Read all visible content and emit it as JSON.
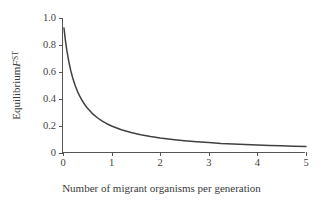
{
  "chart_data": {
    "type": "line",
    "title": "",
    "xlabel": "Number of migrant organisms per generation",
    "ylabel_plain": "Equilibrium FST",
    "ylabel_parts": {
      "prefix": "Equilibrium ",
      "variable": "F",
      "subscript": "ST"
    },
    "xlim": [
      0,
      5
    ],
    "ylim": [
      0,
      1.0
    ],
    "xticks": [
      0,
      1,
      2,
      3,
      4,
      5
    ],
    "xtick_labels": [
      "0",
      "1",
      "2",
      "3",
      "4",
      "5"
    ],
    "yticks": [
      0,
      0.2,
      0.4,
      0.6,
      0.8,
      1.0
    ],
    "ytick_labels": [
      "0",
      "0.2",
      "0.4",
      "0.6",
      "0.8",
      "1.0"
    ],
    "grid": false,
    "legend": null,
    "series": [
      {
        "name": "Equilibrium FST = 1/(4Nm + 1)",
        "color": "#404040",
        "x": [
          0.02,
          0.05,
          0.08,
          0.12,
          0.16,
          0.2,
          0.25,
          0.3,
          0.35,
          0.4,
          0.45,
          0.5,
          0.6,
          0.7,
          0.8,
          0.9,
          1.0,
          1.2,
          1.4,
          1.6,
          1.8,
          2.0,
          2.25,
          2.5,
          2.75,
          3.0,
          3.25,
          3.5,
          3.75,
          4.0,
          4.25,
          4.5,
          4.75,
          5.0
        ],
        "y": [
          0.926,
          0.833,
          0.758,
          0.676,
          0.61,
          0.556,
          0.5,
          0.455,
          0.417,
          0.385,
          0.357,
          0.333,
          0.294,
          0.263,
          0.238,
          0.217,
          0.2,
          0.172,
          0.152,
          0.135,
          0.122,
          0.111,
          0.1,
          0.091,
          0.083,
          0.077,
          0.071,
          0.067,
          0.063,
          0.059,
          0.056,
          0.053,
          0.05,
          0.048
        ]
      }
    ]
  },
  "axes": {
    "line_color": "#555555",
    "tick_color": "#555555",
    "text_color": "#3a3a3a"
  },
  "figure": {
    "background": "#ffffff"
  }
}
